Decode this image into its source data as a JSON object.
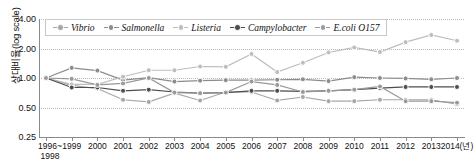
{
  "chart_data": {
    "type": "line",
    "title": "",
    "xlabel": "",
    "ylabel": "상대비율(log scale)",
    "yscale": "log",
    "ylim": [
      0.25,
      4.0
    ],
    "ytick_labels": [
      "4.00",
      "2.00",
      "1.00",
      "0.50",
      "0.25"
    ],
    "ytick_values": [
      4.0,
      2.0,
      1.0,
      0.5,
      0.25
    ],
    "grid": true,
    "legend_position": "top-left-inside",
    "x_axis_unit": "(년)",
    "categories": [
      "1996~1998",
      "1999",
      "2000",
      "2001",
      "2002",
      "2003",
      "2004",
      "2005",
      "2006",
      "2007",
      "2008",
      "2009",
      "2010",
      "2011",
      "2012",
      "2013",
      "2014(년)"
    ],
    "x": [
      "1996~1998",
      "1999",
      "2000",
      "2001",
      "2002",
      "2003",
      "2004",
      "2005",
      "2006",
      "2007",
      "2008",
      "2009",
      "2010",
      "2011",
      "2012",
      "2013",
      "2014"
    ],
    "series": [
      {
        "name": "Vibrio",
        "color": "#a6a6a6",
        "values": [
          1.0,
          0.84,
          0.78,
          0.6,
          0.57,
          0.7,
          0.59,
          0.72,
          0.72,
          0.59,
          0.64,
          0.58,
          0.58,
          0.6,
          0.6,
          0.6,
          0.54
        ]
      },
      {
        "name": "Salmonella",
        "color": "#8c8c8c",
        "values": [
          1.0,
          1.27,
          1.19,
          0.95,
          1.01,
          0.92,
          0.94,
          0.95,
          0.95,
          0.96,
          0.97,
          0.93,
          1.02,
          1.0,
          0.99,
          0.97,
          1.0
        ]
      },
      {
        "name": "Listeria",
        "color": "#bdbdbd",
        "values": [
          1.0,
          0.86,
          0.86,
          1.03,
          1.2,
          1.2,
          1.31,
          1.3,
          1.76,
          1.15,
          1.43,
          1.82,
          2.05,
          1.84,
          2.32,
          2.75,
          2.4
        ]
      },
      {
        "name": "Campylobacter",
        "color": "#4d4d4d",
        "values": [
          1.0,
          0.8,
          0.8,
          0.74,
          0.76,
          0.72,
          0.7,
          0.71,
          0.74,
          0.74,
          0.73,
          0.74,
          0.76,
          0.79,
          0.81,
          0.81,
          0.81
        ]
      },
      {
        "name": "E.coli O157",
        "color": "#999999",
        "values": [
          1.0,
          0.98,
          0.85,
          0.88,
          1.0,
          0.71,
          0.7,
          0.71,
          0.92,
          0.85,
          0.72,
          0.74,
          0.76,
          0.82,
          0.58,
          0.58,
          0.56
        ]
      }
    ]
  }
}
